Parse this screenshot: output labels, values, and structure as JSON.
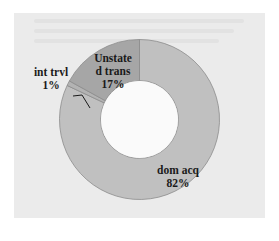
{
  "chart_data": {
    "type": "pie",
    "subtype": "donut",
    "title": "",
    "categories": [
      "dom acq",
      "int trvl",
      "Unstated trans"
    ],
    "values": [
      82,
      1,
      17
    ],
    "unit": "%",
    "colors": [
      "#c0c0c0",
      "#b3b3b3",
      "#a6a6a6"
    ],
    "start_angle_deg": 0,
    "direction": "clockwise",
    "legend": "none",
    "labels": [
      {
        "name": "dom acq",
        "pct": "82%"
      },
      {
        "name": "int trvl",
        "pct": "1%"
      },
      {
        "name_line1": "Unstate",
        "name_line2": "d trans",
        "pct": "17%"
      }
    ]
  },
  "colors": {
    "background": "#ebebeb",
    "page": "#ffffff",
    "slice_border": "#8c8c8c",
    "text": "#1a1a1a"
  }
}
